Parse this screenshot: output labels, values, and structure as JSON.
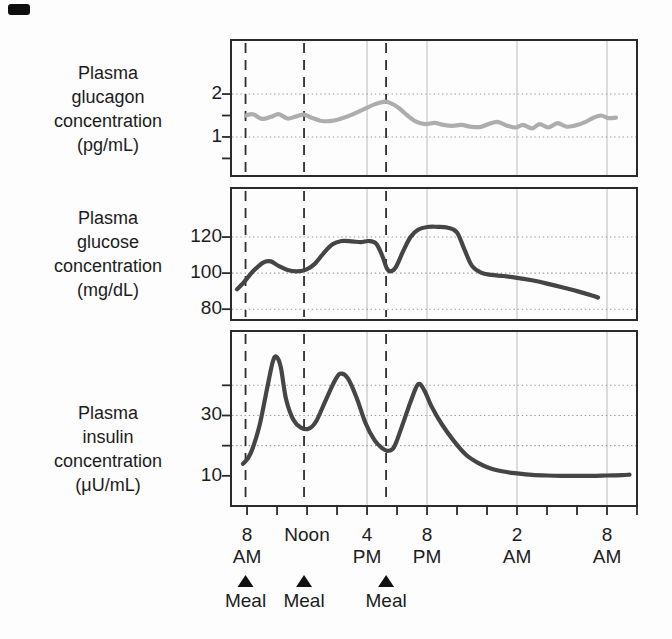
{
  "colors": {
    "background": "#fdfdfd",
    "border": "#2b2b2b",
    "curve_dark": "#454545",
    "curve_light": "#adadad",
    "grid_dotted": "#9b9b9b",
    "grid_vertical": "#c7c7c7",
    "meal_dash": "#2e2e2e",
    "text": "#1c1c1c",
    "marker": "#111111"
  },
  "x_axis": {
    "unit": "clock time (hours, 8 = 8 AM day 1, 32 = 8 AM day 2)",
    "xlim_hours": [
      6.93,
      34
    ],
    "tick_start_hour": 8,
    "tick_end_hour": 34,
    "tick_step_hours": 2,
    "labeled_ticks": [
      {
        "hour": 8,
        "line1": "8",
        "line2": "AM"
      },
      {
        "hour": 12,
        "line1": "Noon",
        "line2": ""
      },
      {
        "hour": 16,
        "line1": "4",
        "line2": "PM"
      },
      {
        "hour": 20,
        "line1": "8",
        "line2": "PM"
      },
      {
        "hour": 26,
        "line1": "2",
        "line2": "AM"
      },
      {
        "hour": 32,
        "line1": "8",
        "line2": "AM"
      }
    ],
    "vertical_gridline_hours": [
      16,
      20,
      26,
      32
    ]
  },
  "meals": {
    "label": "Meal",
    "marker": "filled-up-triangle",
    "hours": [
      7.9,
      11.8,
      17.27
    ]
  },
  "chart_data": [
    {
      "id": "glucagon",
      "type": "line",
      "title": "Plasma glucagon concentration (pg/mL)",
      "label_lines": [
        "Plasma",
        "glucagon",
        "concentration",
        "(pg/mL)"
      ],
      "color_role": "light",
      "ylim": [
        0.09,
        3.26
      ],
      "y_ticks": [
        {
          "v": 2,
          "label": "2"
        },
        {
          "v": 1.5,
          "label": ""
        },
        {
          "v": 1,
          "label": "1"
        },
        {
          "v": 0.5,
          "label": ""
        }
      ],
      "y_gridlines": [
        2,
        1
      ],
      "points_hour_value": [
        [
          7.93,
          1.5
        ],
        [
          8.4,
          1.53
        ],
        [
          9.0,
          1.42
        ],
        [
          9.6,
          1.47
        ],
        [
          10.1,
          1.53
        ],
        [
          10.7,
          1.43
        ],
        [
          11.2,
          1.47
        ],
        [
          11.8,
          1.52
        ],
        [
          12.3,
          1.45
        ],
        [
          12.9,
          1.38
        ],
        [
          13.5,
          1.37
        ],
        [
          14.2,
          1.42
        ],
        [
          15.0,
          1.52
        ],
        [
          15.8,
          1.65
        ],
        [
          16.5,
          1.76
        ],
        [
          17.1,
          1.82
        ],
        [
          17.5,
          1.8
        ],
        [
          18.1,
          1.68
        ],
        [
          18.7,
          1.5
        ],
        [
          19.3,
          1.35
        ],
        [
          19.9,
          1.3
        ],
        [
          20.5,
          1.33
        ],
        [
          21.1,
          1.28
        ],
        [
          21.7,
          1.26
        ],
        [
          22.3,
          1.28
        ],
        [
          22.9,
          1.24
        ],
        [
          23.5,
          1.23
        ],
        [
          24.1,
          1.3
        ],
        [
          24.7,
          1.35
        ],
        [
          25.3,
          1.27
        ],
        [
          25.9,
          1.22
        ],
        [
          26.4,
          1.28
        ],
        [
          27.0,
          1.2
        ],
        [
          27.5,
          1.3
        ],
        [
          28.1,
          1.22
        ],
        [
          28.7,
          1.32
        ],
        [
          29.3,
          1.24
        ],
        [
          29.9,
          1.27
        ],
        [
          30.5,
          1.34
        ],
        [
          31.1,
          1.45
        ],
        [
          31.6,
          1.5
        ],
        [
          32.1,
          1.44
        ],
        [
          32.6,
          1.45
        ]
      ]
    },
    {
      "id": "glucose",
      "type": "line",
      "title": "Plasma glucose concentration (mg/dL)",
      "label_lines": [
        "Plasma",
        "glucose",
        "concentration",
        "(mg/dL)"
      ],
      "color_role": "dark",
      "ylim": [
        74,
        147.2
      ],
      "y_ticks": [
        {
          "v": 120,
          "label": "120"
        },
        {
          "v": 100,
          "label": "100"
        },
        {
          "v": 80,
          "label": "80"
        }
      ],
      "y_gridlines": [
        120,
        100,
        80
      ],
      "points_hour_value": [
        [
          7.33,
          91
        ],
        [
          7.8,
          95
        ],
        [
          8.4,
          101
        ],
        [
          9.1,
          106
        ],
        [
          9.6,
          106.5
        ],
        [
          10.1,
          104
        ],
        [
          10.7,
          101.8
        ],
        [
          11.3,
          101
        ],
        [
          11.9,
          101.8
        ],
        [
          12.5,
          105
        ],
        [
          13.1,
          111
        ],
        [
          13.7,
          116
        ],
        [
          14.3,
          117.8
        ],
        [
          15.0,
          117.6
        ],
        [
          15.6,
          117.2
        ],
        [
          16.1,
          117.8
        ],
        [
          16.6,
          116.5
        ],
        [
          17.0,
          110
        ],
        [
          17.3,
          103
        ],
        [
          17.55,
          101
        ],
        [
          17.9,
          103
        ],
        [
          18.4,
          112
        ],
        [
          18.9,
          120
        ],
        [
          19.4,
          124
        ],
        [
          20.0,
          125.6
        ],
        [
          20.7,
          125.7
        ],
        [
          21.4,
          125.2
        ],
        [
          22.0,
          122.5
        ],
        [
          22.5,
          113
        ],
        [
          23.0,
          104
        ],
        [
          23.6,
          100.3
        ],
        [
          24.3,
          99
        ],
        [
          25.1,
          98.4
        ],
        [
          26.0,
          97.4
        ],
        [
          27.0,
          96
        ],
        [
          28.0,
          94.2
        ],
        [
          29.0,
          92.2
        ],
        [
          30.0,
          90
        ],
        [
          31.0,
          87.6
        ],
        [
          31.4,
          86.5
        ]
      ]
    },
    {
      "id": "insulin",
      "type": "line",
      "title": "Plasma insulin concentration (μU/mL)",
      "label_lines": [
        "Plasma",
        "insulin",
        "concentration",
        "(μU/mL)"
      ],
      "color_role": "dark",
      "ylim": [
        0,
        58
      ],
      "y_ticks": [
        {
          "v": 40,
          "label": ""
        },
        {
          "v": 30,
          "label": "30"
        },
        {
          "v": 20,
          "label": ""
        },
        {
          "v": 10,
          "label": "10"
        }
      ],
      "y_gridlines": [
        40,
        30,
        20
      ],
      "points_hour_value": [
        [
          7.73,
          14
        ],
        [
          8.2,
          17
        ],
        [
          8.8,
          26
        ],
        [
          9.3,
          38
        ],
        [
          9.7,
          47.5
        ],
        [
          9.95,
          49.5
        ],
        [
          10.25,
          46
        ],
        [
          10.6,
          35.5
        ],
        [
          11.1,
          28.5
        ],
        [
          11.6,
          26
        ],
        [
          12.1,
          25.6
        ],
        [
          12.6,
          28
        ],
        [
          13.2,
          34.5
        ],
        [
          13.8,
          41
        ],
        [
          14.2,
          43.8
        ],
        [
          14.7,
          42.5
        ],
        [
          15.3,
          36
        ],
        [
          15.9,
          27.5
        ],
        [
          16.5,
          21.8
        ],
        [
          17.0,
          19.2
        ],
        [
          17.4,
          18.3
        ],
        [
          17.8,
          19.5
        ],
        [
          18.3,
          26
        ],
        [
          18.9,
          34.5
        ],
        [
          19.4,
          40.3
        ],
        [
          19.8,
          38.5
        ],
        [
          20.3,
          33
        ],
        [
          21.0,
          27
        ],
        [
          21.8,
          21.5
        ],
        [
          22.6,
          17
        ],
        [
          23.4,
          14.3
        ],
        [
          24.2,
          12.5
        ],
        [
          25.0,
          11.5
        ],
        [
          26.0,
          10.8
        ],
        [
          27.0,
          10.3
        ],
        [
          28.0,
          10.1
        ],
        [
          29.0,
          10
        ],
        [
          30.0,
          10
        ],
        [
          31.0,
          10
        ],
        [
          32.0,
          10.1
        ],
        [
          33.0,
          10.2
        ],
        [
          33.5,
          10.4
        ]
      ]
    }
  ]
}
